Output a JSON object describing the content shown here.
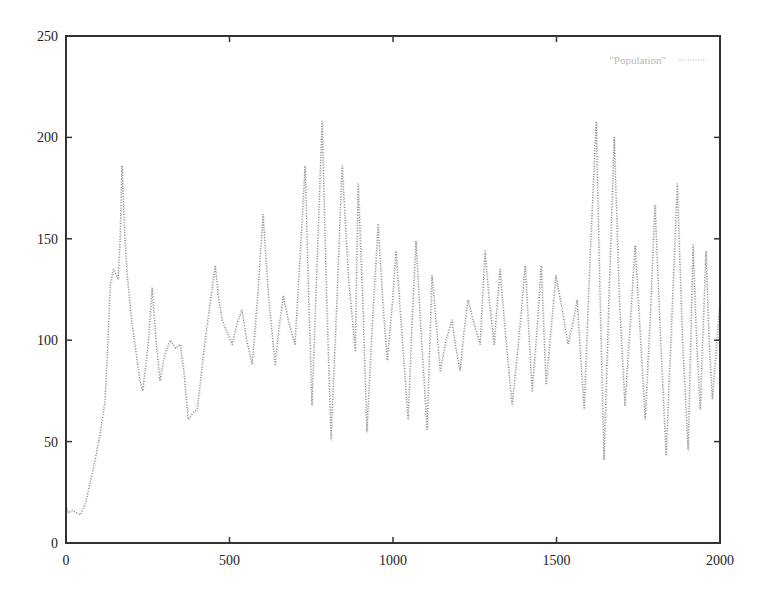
{
  "chart_data": {
    "type": "line",
    "title": "",
    "xlabel": "",
    "ylabel": "",
    "xlim": [
      0,
      2000
    ],
    "ylim": [
      0,
      250
    ],
    "xticks": [
      0,
      500,
      1000,
      1500,
      2000
    ],
    "yticks": [
      0,
      50,
      100,
      150,
      200,
      250
    ],
    "xtick_labels": [
      "0",
      "500",
      "1000",
      "1500",
      "2000"
    ],
    "ytick_labels": [
      "0",
      "50",
      "100",
      "150",
      "200",
      "250"
    ],
    "grid": false,
    "legend": {
      "position": "top-right",
      "entries": [
        "\"Population\""
      ]
    },
    "series": [
      {
        "name": "\"Population\"",
        "style": "dotted",
        "color": "#8a8a8a",
        "x": [
          0,
          6,
          20,
          43,
          60,
          89,
          105,
          119,
          128,
          135,
          145,
          159,
          165,
          171,
          180,
          187,
          200,
          226,
          234,
          242,
          252,
          263,
          275,
          287,
          300,
          318,
          335,
          349,
          360,
          373,
          387,
          401,
          425,
          456,
          465,
          477,
          492,
          508,
          522,
          538,
          552,
          569,
          585,
          602,
          620,
          639,
          650,
          664,
          682,
          700,
          715,
          731,
          742,
          752,
          768,
          783,
          797,
          810,
          828,
          844,
          864,
          884,
          893,
          907,
          920,
          937,
          954,
          968,
          982,
          996,
          1009,
          1028,
          1046,
          1058,
          1070,
          1087,
          1104,
          1119,
          1131,
          1144,
          1162,
          1180,
          1192,
          1205,
          1217,
          1229,
          1248,
          1266,
          1281,
          1295,
          1309,
          1327,
          1345,
          1364,
          1384,
          1404,
          1425,
          1440,
          1453,
          1468,
          1483,
          1498,
          1517,
          1535,
          1549,
          1563,
          1574,
          1584,
          1602,
          1621,
          1633,
          1645,
          1660,
          1676,
          1692,
          1709,
          1724,
          1740,
          1755,
          1771,
          1786,
          1801,
          1818,
          1835,
          1852,
          1869,
          1885,
          1902,
          1917,
          1928,
          1939,
          1948,
          1957,
          1966,
          1976,
          1988,
          2000
        ],
        "values": [
          18,
          15,
          16,
          14,
          20,
          41,
          55,
          70,
          100,
          127,
          135,
          130,
          150,
          186,
          150,
          132,
          110,
          80,
          75,
          85,
          100,
          126,
          100,
          80,
          92,
          100,
          96,
          98,
          85,
          61,
          64,
          66,
          100,
          137,
          122,
          110,
          104,
          98,
          108,
          115,
          100,
          88,
          120,
          162,
          120,
          88,
          105,
          122,
          108,
          98,
          140,
          186,
          120,
          68,
          140,
          208,
          120,
          51,
          120,
          186,
          130,
          95,
          177,
          120,
          55,
          110,
          157,
          120,
          90,
          115,
          144,
          100,
          61,
          110,
          149,
          100,
          56,
          132,
          110,
          85,
          100,
          110,
          96,
          85,
          105,
          120,
          108,
          98,
          144,
          118,
          98,
          135,
          100,
          68,
          100,
          137,
          75,
          105,
          137,
          78,
          105,
          132,
          115,
          98,
          108,
          120,
          90,
          66,
          140,
          208,
          120,
          41,
          120,
          200,
          120,
          68,
          105,
          147,
          105,
          61,
          110,
          167,
          100,
          43,
          110,
          177,
          100,
          46,
          147,
          100,
          66,
          105,
          144,
          100,
          71,
          95,
          120
        ]
      }
    ]
  },
  "layout": {
    "plot_left": 66,
    "plot_right": 720,
    "plot_top": 36,
    "plot_bottom": 543,
    "axis_color": "#333333",
    "line_color": "#8a8a8a"
  }
}
